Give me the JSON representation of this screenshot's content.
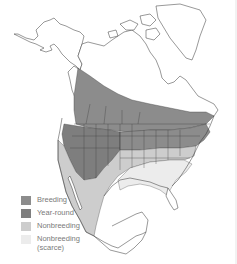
{
  "map": {
    "region": "North America",
    "colors": {
      "breeding": "#8c8c8c",
      "year_round": "#7e7e7e",
      "nonbreeding": "#cdcdcd",
      "nonbreeding_scarce": "#ececec",
      "land": "#ffffff",
      "border": "#333333"
    }
  },
  "legend": {
    "items": [
      {
        "label": "Breeding",
        "color": "#8c8c8c"
      },
      {
        "label": "Year-round",
        "color": "#7e7e7e"
      },
      {
        "label": "Nonbreeding",
        "color": "#cdcdcd"
      },
      {
        "label": "Nonbreeding (scarce)",
        "label_line1": "Nonbreeding",
        "label_line2": "(scarce)",
        "color": "#ececec"
      }
    ]
  }
}
